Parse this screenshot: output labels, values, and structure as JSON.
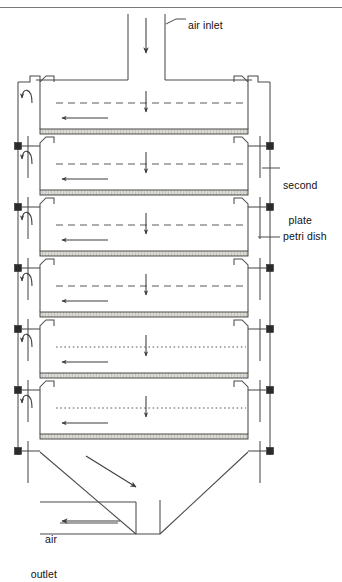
{
  "figure": {
    "title_fragment": "",
    "labels": {
      "air_inlet": "air inlet",
      "second_plate": "second\nplate",
      "second_plate_line1": "second",
      "second_plate_line2": "plate",
      "petri_dish": "petri dish",
      "air_outlet": "air\noutlet",
      "air_outlet_line1": "air",
      "air_outlet_line2": "outlet"
    },
    "colors": {
      "line": "#4a4a4a",
      "dash": "#5a5a5a",
      "plate_fill": "#d8d6d0",
      "plate_edge": "#3a3a3a",
      "node": "#2b2b2b",
      "text": "#111111",
      "background": "#ffffff",
      "header_rule": "#7a7a7a"
    },
    "geometry": {
      "canvas_width": 342,
      "canvas_height": 552,
      "column_left": 18,
      "column_right": 270,
      "inlet_chimney_left": 128,
      "inlet_chimney_right": 165,
      "inlet_chimney_top": 14,
      "funnel_shoulder_y": 80,
      "shelf_count": 6,
      "first_plate_y": 129,
      "shelf_pitch": 61,
      "plate_thickness": 5,
      "plate_left": 40,
      "plate_right": 248,
      "outlet_y": 523,
      "outlet_x": 18
    },
    "shelves": [
      {
        "index": 1,
        "plate_y": 129,
        "flow_style": "dashed",
        "has_down_arrow": true,
        "has_left_arrow": true,
        "has_curl_arrow": true
      },
      {
        "index": 2,
        "plate_y": 190,
        "flow_style": "dashed",
        "has_down_arrow": true,
        "has_left_arrow": true,
        "has_curl_arrow": true
      },
      {
        "index": 3,
        "plate_y": 251,
        "flow_style": "dashed",
        "has_down_arrow": true,
        "has_left_arrow": true,
        "has_curl_arrow": true
      },
      {
        "index": 4,
        "plate_y": 312,
        "flow_style": "dashed",
        "has_down_arrow": true,
        "has_left_arrow": true,
        "has_curl_arrow": true
      },
      {
        "index": 5,
        "plate_y": 373,
        "flow_style": "dotted",
        "has_down_arrow": true,
        "has_left_arrow": true,
        "has_curl_arrow": true
      },
      {
        "index": 6,
        "plate_y": 434,
        "flow_style": "dotted",
        "has_down_arrow": true,
        "has_left_arrow": true,
        "has_curl_arrow": true
      }
    ],
    "connector_nodes_y": [
      146,
      207,
      268,
      329,
      390,
      451
    ],
    "arrows": {
      "inlet_down": {
        "x": 146,
        "y1": 18,
        "y2": 52
      },
      "lower_diagonal": {
        "x1": 88,
        "y1": 458,
        "x2": 136,
        "y2": 486
      },
      "outlet_left": {
        "x1": 118,
        "y": 523,
        "x2": 62
      }
    }
  }
}
